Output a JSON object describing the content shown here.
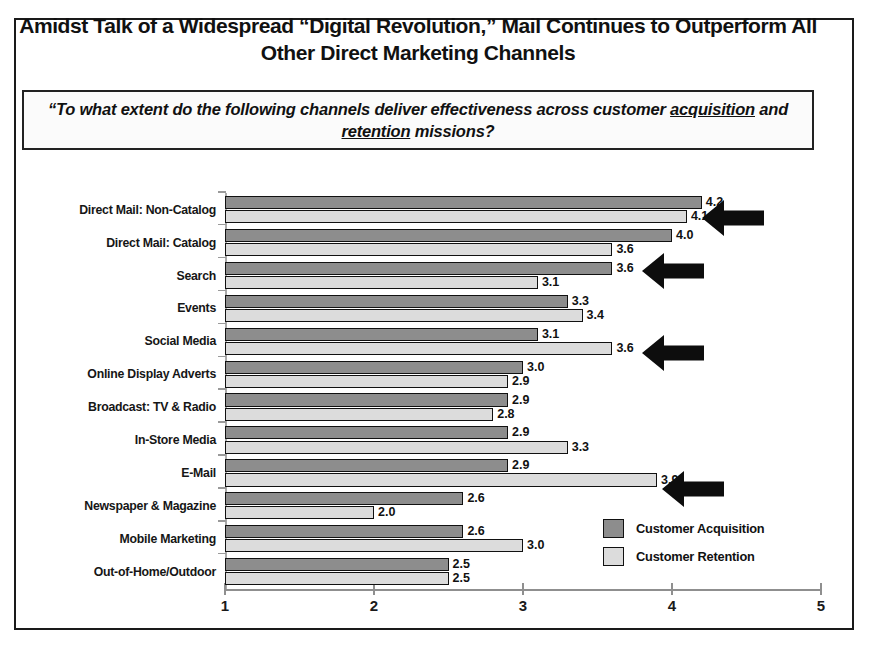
{
  "title": "Amidst Talk of a Widespread “Digital Revolution,” Mail Continues to Outperform All Other Direct Marketing Channels",
  "subtitle": {
    "part1": "“To what extent do the following channels deliver effectiveness across customer ",
    "underline1": "acquisition",
    "part2": " and ",
    "underline2": "retention",
    "part3": " missions?"
  },
  "legend": {
    "items": [
      {
        "label": "Customer Acquisition",
        "color": "#8d8d8d"
      },
      {
        "label": "Customer Retention",
        "color": "#dcdcdc"
      }
    ]
  },
  "axis": {
    "ticks": [
      "1",
      "2",
      "3",
      "4",
      "5"
    ],
    "min": 1,
    "max": 5
  },
  "annotations": [
    {
      "name": "arrow-direct-mail-non-catalog",
      "target": "Direct Mail: Non-Catalog"
    },
    {
      "name": "arrow-search-acquisition",
      "target": "Search / Direct Mail: Catalog retention"
    },
    {
      "name": "arrow-social-media-retention",
      "target": "Social Media retention"
    },
    {
      "name": "arrow-email-retention",
      "target": "E-Mail retention"
    }
  ],
  "chart_data": {
    "type": "bar",
    "orientation": "horizontal",
    "title": "Amidst Talk of a Widespread “Digital Revolution,” Mail Continues to Outperform All Other Direct Marketing Channels",
    "subtitle": "“To what extent do the following channels deliver effectiveness across customer acquisition and retention missions?",
    "categories": [
      "Direct Mail: Non-Catalog",
      "Direct Mail: Catalog",
      "Search",
      "Events",
      "Social Media",
      "Online Display Adverts",
      "Broadcast: TV & Radio",
      "In-Store Media",
      "E-Mail",
      "Newspaper & Magazine",
      "Mobile Marketing",
      "Out-of-Home/Outdoor"
    ],
    "series": [
      {
        "name": "Customer Acquisition",
        "color": "#8d8d8d",
        "values": [
          4.2,
          4.0,
          3.6,
          3.3,
          3.1,
          3.0,
          2.9,
          2.9,
          2.9,
          2.6,
          2.6,
          2.5
        ]
      },
      {
        "name": "Customer Retention",
        "color": "#dcdcdc",
        "values": [
          4.1,
          3.6,
          3.1,
          3.4,
          3.6,
          2.9,
          2.8,
          3.3,
          3.9,
          2.0,
          3.0,
          2.5
        ]
      }
    ],
    "xlabel": "",
    "ylabel": "",
    "xlim": [
      1,
      5
    ],
    "xticks": [
      1,
      2,
      3,
      4,
      5
    ],
    "grid": false,
    "legend_position": "bottom-right",
    "data_labels": true
  }
}
